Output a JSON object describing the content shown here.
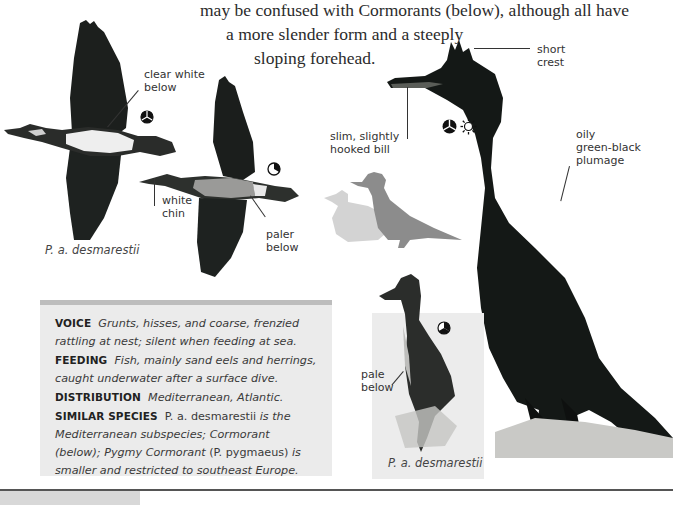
{
  "intro_text": {
    "line0": "may be confused with Cormorants (below), although all have",
    "line1": "a more slender form and a steeply",
    "line2": "sloping forehead."
  },
  "labels": {
    "clear_white_below": [
      "clear white",
      "below"
    ],
    "white_chin": [
      "white",
      "chin"
    ],
    "paler_below": [
      "paler",
      "below"
    ],
    "short_crest": [
      "short",
      "crest"
    ],
    "slim_bill": [
      "slim, slightly",
      "hooked bill"
    ],
    "oily_plumage": [
      "oily",
      "green-black",
      "plumage"
    ],
    "pale_below": [
      "pale",
      "below"
    ]
  },
  "captions": {
    "flight_caption": "P. a. desmarestii",
    "juvenile_caption": "P. a. desmarestii"
  },
  "icons": {
    "season_icon_flight1": "season-pie-icon",
    "season_icon_flight2": "season-pie-icon",
    "season_icon_adult": "season-pie-icon",
    "sun_icon": "sun-icon",
    "season_icon_juvenile": "season-pie-icon"
  },
  "info": {
    "voice_label": "VOICE",
    "voice_text": "Grunts, hisses, and coarse, frenzied rattling at nest; silent when feeding at sea.",
    "feeding_label": "FEEDING",
    "feeding_text": "Fish, mainly sand eels and herrings, caught underwater after a surface dive.",
    "distribution_label": "DISTRIBUTION",
    "distribution_text": "Mediterranean, Atlantic.",
    "similar_label": "SIMILAR SPECIES",
    "similar_sp1": "P. a. desmarestii",
    "similar_t1": "is the Mediterranean subspecies; Cormorant (below); Pygmy Cormorant",
    "similar_sp2": "(P. pygmaeus)",
    "similar_t2": "is smaller and restricted to southeast Europe."
  },
  "colors": {
    "info_box_bg": "#ebebeb",
    "info_box_bar": "#bdbdbd",
    "bird_dark": "#151a17",
    "silhouette_dark": "#8c8c8c",
    "silhouette_light": "#d3d3d3"
  }
}
